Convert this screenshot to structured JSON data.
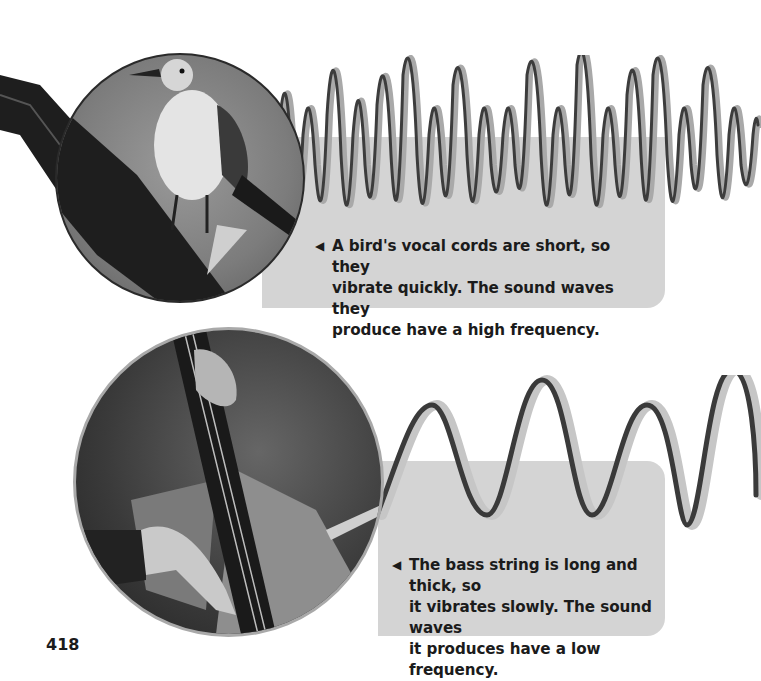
{
  "page": {
    "number": "418"
  },
  "figures": {
    "bird": {
      "image": "bird-on-branch-photo",
      "wave": "high-frequency-sound-wave",
      "caption": "A bird's vocal cords are short, so they vibrate quickly. The sound waves they produce have a high frequency.",
      "caption_lines": [
        "A bird's vocal cords are short, so they",
        "vibrate quickly. The sound waves they",
        "produce have a high frequency."
      ],
      "pointer_icon": "◀"
    },
    "bass": {
      "image": "bass-string-player-photo",
      "wave": "low-frequency-sound-wave",
      "caption": "The bass string is long and thick, so it vibrates slowly. The sound waves it produces have a low frequency.",
      "caption_lines": [
        "The bass string is long and thick, so",
        "it vibrates slowly. The sound waves",
        "it produces have a low frequency."
      ],
      "pointer_icon": "◀"
    }
  },
  "colors": {
    "panel": "#d4d4d4",
    "text": "#1b1b1b",
    "wave_dark": "#3a3a3a",
    "wave_light": "#a8a8a8"
  }
}
